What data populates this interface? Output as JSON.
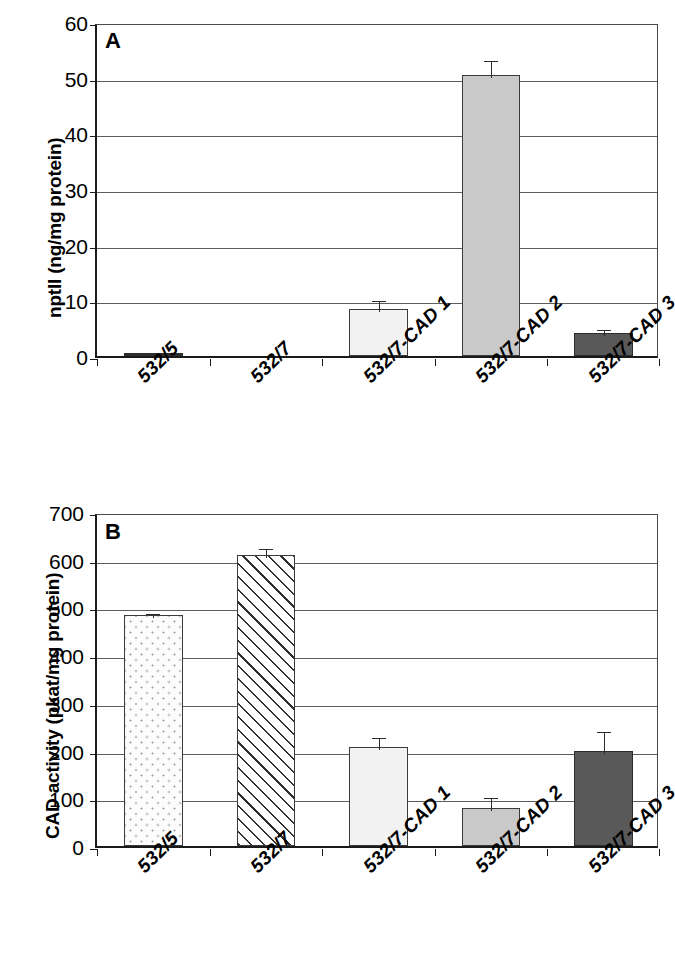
{
  "figure": {
    "categories": [
      "532/5",
      "532/7",
      "532/7-CAD 1",
      "532/7-CAD 2",
      "532/7-CAD 3"
    ],
    "colors": {
      "solid_light": "#f2f2f2",
      "solid_mid": "#c9c9c9",
      "solid_dark": "#595959",
      "axis": "#1a1a1a",
      "grid": "#5d5d5d"
    }
  },
  "panels": [
    {
      "letter": "A",
      "ylabel": "nptII (ng/mg protein)",
      "ticks": [
        "60",
        "50",
        "40",
        "30",
        "20",
        "10",
        "0"
      ]
    },
    {
      "letter": "B",
      "ylabel": "CAD activity (pkat/mg protein)",
      "ticks": [
        "700",
        "600",
        "500",
        "400",
        "300",
        "200",
        "100",
        "0"
      ]
    }
  ],
  "chart_data": [
    {
      "type": "bar",
      "panel": "A",
      "title": "",
      "xlabel": "",
      "ylabel": "nptII (ng/mg protein)",
      "ylim": [
        0,
        60
      ],
      "yticks": [
        0,
        10,
        20,
        30,
        40,
        50,
        60
      ],
      "grid": true,
      "legend": "none",
      "categories": [
        "532/5",
        "532/7",
        "532/7-CAD 1",
        "532/7-CAD 2",
        "532/7-CAD 3"
      ],
      "values": [
        0.2,
        0,
        8.5,
        50.5,
        4.1
      ],
      "errors": [
        0,
        0,
        2.0,
        3.0,
        1.1
      ],
      "fills": [
        "solid-dark",
        "none",
        "solid-light",
        "solid-mid",
        "solid-dark"
      ]
    },
    {
      "type": "bar",
      "panel": "B",
      "title": "",
      "xlabel": "",
      "ylabel": "CAD activity (pkat/mg protein)",
      "ylim": [
        0,
        700
      ],
      "yticks": [
        0,
        100,
        200,
        300,
        400,
        500,
        600,
        700
      ],
      "grid": true,
      "legend": "none",
      "categories": [
        "532/5",
        "532/7",
        "532/7-CAD 1",
        "532/7-CAD 2",
        "532/7-CAD 3"
      ],
      "values": [
        485,
        610,
        208,
        80,
        200
      ],
      "errors": [
        8,
        18,
        25,
        27,
        45
      ],
      "fills": [
        "dotted",
        "hatched",
        "solid-light",
        "solid-mid",
        "solid-dark"
      ]
    }
  ]
}
